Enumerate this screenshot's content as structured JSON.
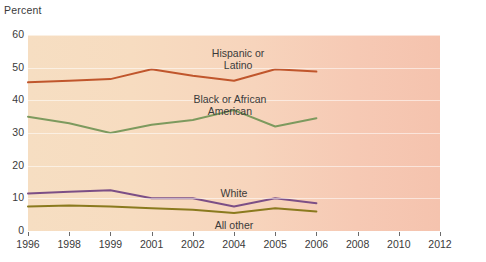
{
  "chart_data": {
    "type": "line",
    "title": "",
    "ylabel": "Percent",
    "xlabel": "",
    "ylim": [
      0,
      60
    ],
    "yticks": [
      0,
      10,
      20,
      30,
      40,
      50,
      60
    ],
    "xticks": [
      "1996",
      "1998",
      "1999",
      "2001",
      "2002",
      "2004",
      "2005",
      "2006",
      "2008",
      "2010",
      "2012"
    ],
    "x": [
      "1996",
      "1998",
      "1999",
      "2001",
      "2002",
      "2004",
      "2005",
      "2006"
    ],
    "grid": true,
    "legend_position": "inline-annotations",
    "series": [
      {
        "name": "Hispanic or Latino",
        "color": "#c0562c",
        "values": [
          45.5,
          46.0,
          46.5,
          49.5,
          47.5,
          46.0,
          49.5,
          48.8
        ]
      },
      {
        "name": "Black or African American",
        "color": "#7d9a5e",
        "values": [
          35.0,
          33.0,
          30.0,
          32.5,
          34.0,
          37.0,
          32.0,
          34.5
        ]
      },
      {
        "name": "White",
        "color": "#7c4f86",
        "values": [
          11.5,
          12.0,
          12.5,
          10.0,
          10.0,
          7.5,
          10.0,
          8.5
        ]
      },
      {
        "name": "All other",
        "color": "#8a7a1e",
        "values": [
          7.5,
          7.8,
          7.5,
          7.0,
          6.5,
          5.5,
          7.0,
          6.0
        ]
      }
    ],
    "annotations": [
      {
        "text_line1": "Hispanic or",
        "text_line2": "Latino",
        "x_frac": 0.51,
        "y_px": 47
      },
      {
        "text_line1": "Black or African",
        "text_line2": "American",
        "x_frac": 0.49,
        "y_px": 93
      },
      {
        "text_line1": "White",
        "text_line2": "",
        "x_frac": 0.5,
        "y_px": 187
      },
      {
        "text_line1": "All other",
        "text_line2": "",
        "x_frac": 0.5,
        "y_px": 219
      }
    ],
    "colors": {
      "plot_background_left": "#f6dec2",
      "plot_background_right": "#f5c3ae",
      "page_background": "#ffffff",
      "text": "#3a3a3a",
      "gridline": "#ffffff"
    }
  }
}
